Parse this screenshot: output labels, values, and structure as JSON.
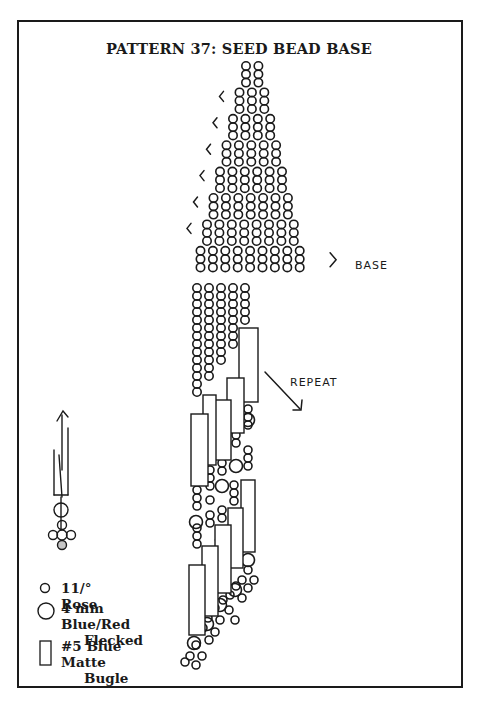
{
  "title": "PATTERN 37:  SEED BEAD BASE",
  "labels": {
    "base": "BASE",
    "repeat": "REPEAT"
  },
  "legend": [
    {
      "icon": "small-circle-icon",
      "line1": "11/° Rose",
      "line2": ""
    },
    {
      "icon": "large-circle-icon",
      "line1": "4 mm Blue/Red",
      "line2": "Flecked"
    },
    {
      "icon": "rectangle-icon",
      "line1": "#5 Blue Matte",
      "line2": "Bugle"
    }
  ],
  "pyramid": {
    "rows": [
      {
        "columns": 2,
        "stack": 3,
        "left_marker": false
      },
      {
        "columns": 3,
        "stack": 3,
        "left_marker": true
      },
      {
        "columns": 4,
        "stack": 3,
        "left_marker": true
      },
      {
        "columns": 5,
        "stack": 3,
        "left_marker": true
      },
      {
        "columns": 6,
        "stack": 3,
        "left_marker": true
      },
      {
        "columns": 7,
        "stack": 3,
        "left_marker": true
      },
      {
        "columns": 8,
        "stack": 3,
        "left_marker": true
      },
      {
        "columns": 9,
        "stack": 3,
        "left_marker": false,
        "right_marker": "BASE"
      }
    ]
  },
  "colors": {
    "ink": "#1a1a1a",
    "paper": "#ffffff"
  }
}
